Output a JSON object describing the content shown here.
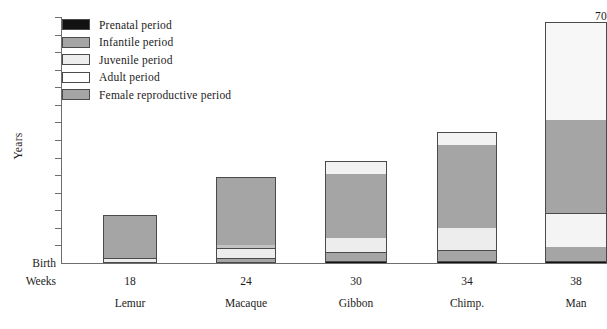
{
  "chart_data": {
    "type": "bar",
    "title": "",
    "subtitle": "",
    "xlabel": "",
    "ylabel": "Years",
    "ylim": [
      0,
      70
    ],
    "grid": false,
    "legend_position": "top-left",
    "stacked": true,
    "baseline_label": "Birth",
    "second_axis_label": "Weeks",
    "y_ticks": [
      {
        "value": 70,
        "label": "70"
      },
      {
        "value": 65,
        "label": ""
      },
      {
        "value": 60,
        "label": "60"
      },
      {
        "value": 55,
        "label": ""
      },
      {
        "value": 50,
        "label": "50"
      },
      {
        "value": 45,
        "label": ""
      },
      {
        "value": 40,
        "label": "40"
      },
      {
        "value": 35,
        "label": ""
      },
      {
        "value": 30,
        "label": "30"
      },
      {
        "value": 25,
        "label": ""
      },
      {
        "value": 20,
        "label": "20"
      },
      {
        "value": 15,
        "label": ""
      },
      {
        "value": 10,
        "label": "10"
      },
      {
        "value": 5,
        "label": "5"
      },
      {
        "value": 0,
        "label": "Birth"
      }
    ],
    "categories": [
      "Lemur",
      "Macaque",
      "Gibbon",
      "Chimp.",
      "Man"
    ],
    "gestation_weeks": [
      "18",
      "24",
      "30",
      "34",
      "38"
    ],
    "legend": [
      {
        "key": "prenatal",
        "label": "Prenatal period",
        "color": "#121212"
      },
      {
        "key": "infantile",
        "label": "Infantile period",
        "color": "#a5a5a5"
      },
      {
        "key": "juvenile",
        "label": "Juvenile period",
        "color": "#ededed"
      },
      {
        "key": "adult",
        "label": "Adult period",
        "color": "#ffffff"
      },
      {
        "key": "female_reproductive",
        "label": "Female reproductive period",
        "color": "#a5a5a5"
      }
    ],
    "series": [
      {
        "name": "Prenatal period",
        "key": "prenatal",
        "color": "#121212",
        "values": [
          0.9,
          1.1,
          1.2,
          1.3,
          1.4
        ]
      },
      {
        "name": "Infantile period",
        "key": "infantile",
        "color": "#a5a5a5",
        "values": [
          0.8,
          0.9,
          2.3,
          2.7,
          4.1
        ]
      },
      {
        "name": "Juvenile period",
        "key": "juvenile",
        "color": "#ededed",
        "values": [
          1.0,
          2.4,
          4.0,
          6.5,
          14.5
        ]
      },
      {
        "name": "Female reproductive period",
        "key": "female_reproductive",
        "color": "#a5a5a5",
        "values": [
          14.8,
          19.6,
          21.5,
          26.0,
          22.0
        ]
      },
      {
        "name": "Adult period",
        "key": "adult",
        "color": "#ffffff",
        "values": [
          0.0,
          0.5,
          0.5,
          3.0,
          27.5
        ]
      }
    ],
    "totals": [
      17.5,
      24.5,
      29.5,
      39.5,
      69.5
    ],
    "annotations": []
  },
  "bars": [
    {
      "name": "Lemur",
      "weeks": "18",
      "total": 17.5,
      "left": 103,
      "width": 54,
      "segments": [
        {
          "key": "prenatal",
          "color": "#121212",
          "height_px": 3,
          "divider": true
        },
        {
          "key": "juvenile",
          "color": "#ededed",
          "height_px": 3,
          "divider": true
        },
        {
          "key": "infantile",
          "color": "#a5a5a5",
          "height_px": 3,
          "divider": true
        },
        {
          "key": "female_reproductive",
          "color": "#a5a5a5",
          "height_px": 39,
          "divider": false
        }
      ]
    },
    {
      "name": "Macaque",
      "weeks": "24",
      "total": 24.5,
      "left": 216,
      "width": 60,
      "segments": [
        {
          "key": "prenatal",
          "color": "#121212",
          "height_px": 4,
          "divider": true
        },
        {
          "key": "infantile",
          "color": "#a5a5a5",
          "height_px": 3,
          "divider": true
        },
        {
          "key": "juvenile",
          "color": "#ededed",
          "height_px": 9,
          "divider": true
        },
        {
          "key": "adult",
          "color": "#c3c3c3",
          "height_px": 3,
          "divider": true
        },
        {
          "key": "female_reproductive",
          "color": "#a5a5a5",
          "height_px": 67,
          "divider": false
        }
      ]
    },
    {
      "name": "Gibbon",
      "weeks": "30",
      "total": 29.5,
      "left": 325,
      "width": 62,
      "segments": [
        {
          "key": "prenatal",
          "color": "#121212",
          "height_px": 4,
          "divider": true
        },
        {
          "key": "infantile",
          "color": "#a5a5a5",
          "height_px": 8,
          "divider": true
        },
        {
          "key": "juvenile",
          "color": "#ededed",
          "height_px": 14,
          "divider": true
        },
        {
          "key": "female_reproductive",
          "color": "#a5a5a5",
          "height_px": 64,
          "divider": false
        },
        {
          "key": "adult",
          "color": "#f2f2f2",
          "height_px": 12,
          "divider": false
        }
      ]
    },
    {
      "name": "Chimp.",
      "weeks": "34",
      "total": 39.5,
      "left": 437,
      "width": 60,
      "segments": [
        {
          "key": "prenatal",
          "color": "#121212",
          "height_px": 4,
          "divider": true
        },
        {
          "key": "infantile",
          "color": "#a5a5a5",
          "height_px": 10,
          "divider": true
        },
        {
          "key": "juvenile",
          "color": "#ededed",
          "height_px": 22,
          "divider": true
        },
        {
          "key": "female_reproductive",
          "color": "#a5a5a5",
          "height_px": 83,
          "divider": false
        },
        {
          "key": "adult",
          "color": "#f2f2f2",
          "height_px": 12,
          "divider": false
        }
      ]
    },
    {
      "name": "Man",
      "weeks": "38",
      "total": 69.5,
      "left": 545,
      "width": 62,
      "segments": [
        {
          "key": "prenatal",
          "color": "#121212",
          "height_px": 4,
          "divider": false
        },
        {
          "key": "infantile",
          "color": "#a5a5a5",
          "height_px": 14,
          "divider": true
        },
        {
          "key": "juvenile",
          "color": "#f4f4f4",
          "height_px": 33,
          "divider": false
        },
        {
          "key": "female_reproductive_low",
          "color": "#a5a5a5",
          "height_px": 19,
          "divider": true
        },
        {
          "key": "female_reproductive",
          "color": "#a5a5a5",
          "height_px": 74,
          "divider": false
        },
        {
          "key": "adult",
          "color": "#f7f7f7",
          "height_px": 97,
          "divider": false
        }
      ]
    }
  ],
  "axis": {
    "y_title": "Years",
    "birth_label": "Birth",
    "weeks_label": "Weeks"
  }
}
